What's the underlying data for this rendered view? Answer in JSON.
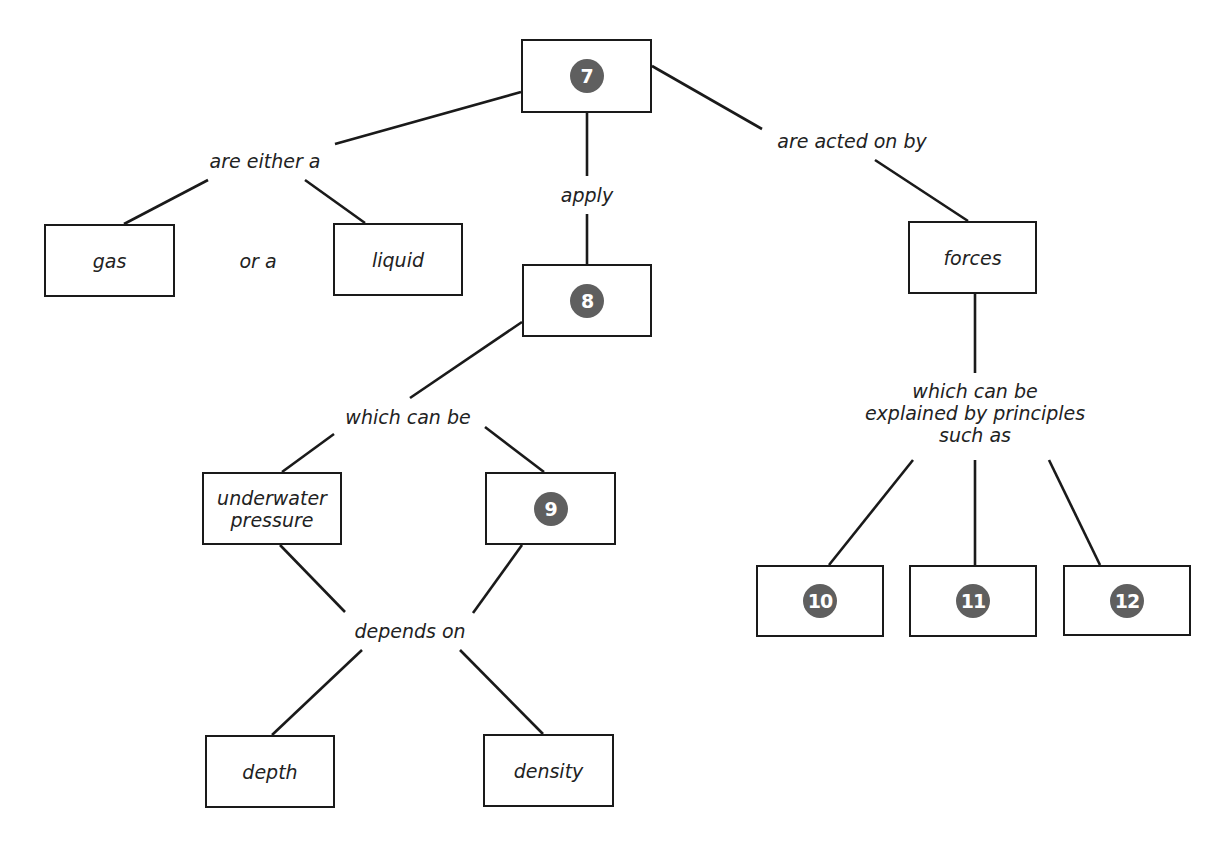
{
  "diagram": {
    "type": "concept-map",
    "nodes": {
      "n7": {
        "kind": "numbered-blank",
        "number": "7"
      },
      "gas": {
        "kind": "text",
        "text": "gas"
      },
      "liquid": {
        "kind": "text",
        "text": "liquid"
      },
      "n8": {
        "kind": "numbered-blank",
        "number": "8"
      },
      "underwater_pressure": {
        "kind": "text",
        "text": "underwater pressure",
        "line1": "underwater",
        "line2": "pressure"
      },
      "n9": {
        "kind": "numbered-blank",
        "number": "9"
      },
      "depth": {
        "kind": "text",
        "text": "depth"
      },
      "density": {
        "kind": "text",
        "text": "density"
      },
      "forces": {
        "kind": "text",
        "text": "forces"
      },
      "n10": {
        "kind": "numbered-blank",
        "number": "10"
      },
      "n11": {
        "kind": "numbered-blank",
        "number": "11"
      },
      "n12": {
        "kind": "numbered-blank",
        "number": "12"
      }
    },
    "link_labels": {
      "are_either_a": "are either a",
      "or_a": "or a",
      "apply": "apply",
      "are_acted_on_by": "are acted on by",
      "which_can_be": "which can be",
      "depends_on": "depends on",
      "explained_line1": "which can be",
      "explained_line2": "explained by principles",
      "explained_line3": "such as"
    },
    "edges": [
      {
        "from": "n7",
        "via": "are either a",
        "to": [
          "gas",
          "liquid"
        ]
      },
      {
        "from": "n7",
        "via": "apply",
        "to": [
          "n8"
        ]
      },
      {
        "from": "n7",
        "via": "are acted on by",
        "to": [
          "forces"
        ]
      },
      {
        "from": "n8",
        "via": "which can be",
        "to": [
          "underwater_pressure",
          "n9"
        ]
      },
      {
        "from": [
          "underwater_pressure",
          "n9"
        ],
        "via": "depends on",
        "to": [
          "depth",
          "density"
        ]
      },
      {
        "from": "forces",
        "via": "which can be explained by principles such as",
        "to": [
          "n10",
          "n11",
          "n12"
        ]
      }
    ],
    "colors": {
      "line": "#1a1a1a",
      "badge": "#5f5f5f",
      "badge_text": "#ffffff",
      "background": "#ffffff"
    }
  }
}
